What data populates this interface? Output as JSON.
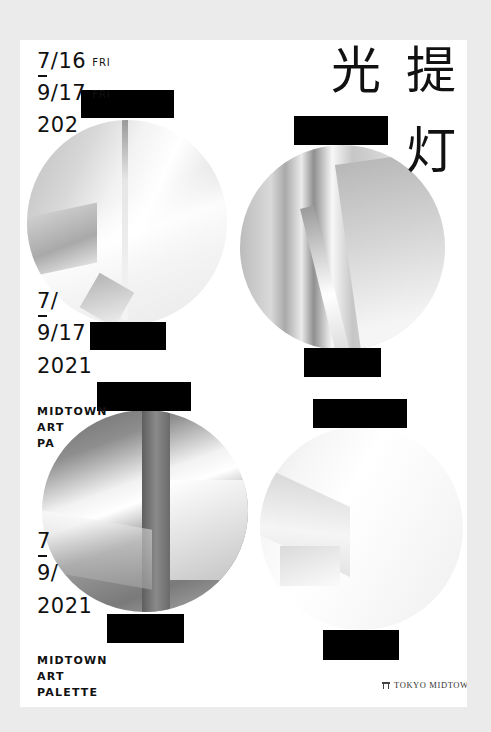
{
  "poster": {
    "title_kanji": [
      "光",
      "提",
      "灯"
    ],
    "date_blocks": [
      {
        "start_date": "7/16",
        "start_day": "FRI",
        "dash": "—",
        "end_date": "9/17",
        "end_day": "FRI",
        "year": "202"
      },
      {
        "start_date": "7/",
        "end_date": "9/17",
        "year": "2021",
        "event_name": "MIDTOWN\nART\nPA"
      },
      {
        "start_date": "7",
        "end_date": "9/",
        "year": "2021",
        "event_name": "MIDTOWN\nART\nPALETTE"
      }
    ],
    "lanterns": [
      {
        "id": "lantern-top-left",
        "tone": "light-gray-abstract"
      },
      {
        "id": "lantern-top-right",
        "tone": "silver-gradient-abstract"
      },
      {
        "id": "lantern-bottom-left",
        "tone": "dark-steel-abstract"
      },
      {
        "id": "lantern-bottom-right",
        "tone": "white-abstract"
      }
    ],
    "logo": {
      "icon": "torii-gate-icon",
      "text": "TOKYO MIDTOWN"
    },
    "colors": {
      "page_background": "#ebebeb",
      "poster_background": "#ffffff",
      "text": "#111111",
      "lantern_caps": "#000000"
    }
  }
}
